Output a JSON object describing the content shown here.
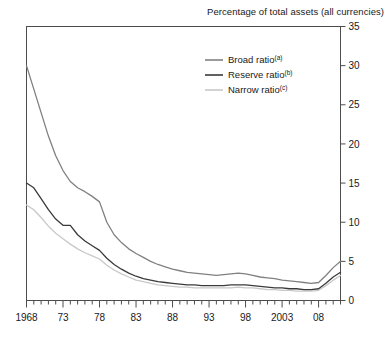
{
  "chart_data": {
    "type": "line",
    "title": "Percentage of total assets (all currencies)",
    "xlabel": "",
    "ylabel": "",
    "ylim": [
      0,
      35
    ],
    "yticks": [
      0,
      5,
      10,
      15,
      20,
      25,
      30,
      35
    ],
    "xlim": [
      1968,
      2011
    ],
    "xticks_major": [
      "1968",
      "73",
      "78",
      "83",
      "88",
      "93",
      "98",
      "2003",
      "08"
    ],
    "xtick_major_years": [
      1968,
      1973,
      1978,
      1983,
      1988,
      1993,
      1998,
      2003,
      2008
    ],
    "xtick_minor_step": 1,
    "grid": false,
    "legend_position": "top-right",
    "x": [
      1968,
      1969,
      1970,
      1971,
      1972,
      1973,
      1974,
      1975,
      1976,
      1977,
      1978,
      1979,
      1980,
      1981,
      1982,
      1983,
      1984,
      1985,
      1986,
      1987,
      1988,
      1989,
      1990,
      1991,
      1992,
      1993,
      1994,
      1995,
      1996,
      1997,
      1998,
      1999,
      2000,
      2001,
      2002,
      2003,
      2004,
      2005,
      2006,
      2007,
      2008,
      2009,
      2010,
      2011
    ],
    "series": [
      {
        "name": "Broad ratio",
        "footnote": "(a)",
        "color": "#808080",
        "values": [
          30.0,
          27.0,
          24.0,
          21.0,
          18.5,
          16.6,
          15.2,
          14.4,
          13.9,
          13.3,
          12.6,
          10.0,
          8.4,
          7.4,
          6.6,
          6.0,
          5.5,
          5.0,
          4.6,
          4.3,
          4.0,
          3.8,
          3.6,
          3.5,
          3.4,
          3.3,
          3.2,
          3.3,
          3.4,
          3.5,
          3.4,
          3.2,
          3.0,
          2.9,
          2.8,
          2.6,
          2.5,
          2.4,
          2.3,
          2.2,
          2.3,
          3.2,
          4.2,
          5.0
        ]
      },
      {
        "name": "Reserve ratio",
        "footnote": "(b)",
        "color": "#3a3a3a",
        "values": [
          15.0,
          14.4,
          13.0,
          11.6,
          10.4,
          9.6,
          9.6,
          8.4,
          7.6,
          7.0,
          6.4,
          5.4,
          4.6,
          4.0,
          3.5,
          3.1,
          2.8,
          2.6,
          2.4,
          2.3,
          2.2,
          2.1,
          2.0,
          2.0,
          1.9,
          1.9,
          1.9,
          1.9,
          2.0,
          2.0,
          2.0,
          1.9,
          1.8,
          1.7,
          1.6,
          1.6,
          1.5,
          1.5,
          1.4,
          1.4,
          1.5,
          2.2,
          3.0,
          3.6
        ]
      },
      {
        "name": "Narrow ratio",
        "footnote": "(c)",
        "color": "#c8c8c8",
        "values": [
          12.2,
          11.6,
          10.6,
          9.5,
          8.6,
          7.9,
          7.2,
          6.6,
          6.1,
          5.7,
          5.3,
          4.5,
          3.9,
          3.4,
          3.0,
          2.6,
          2.4,
          2.2,
          2.0,
          1.9,
          1.8,
          1.7,
          1.7,
          1.6,
          1.6,
          1.6,
          1.6,
          1.6,
          1.6,
          1.7,
          1.6,
          1.6,
          1.5,
          1.4,
          1.4,
          1.3,
          1.3,
          1.2,
          1.2,
          1.2,
          1.3,
          1.9,
          2.6,
          3.2
        ]
      }
    ]
  },
  "axis": {
    "frame_color": "#4d4d4d"
  }
}
